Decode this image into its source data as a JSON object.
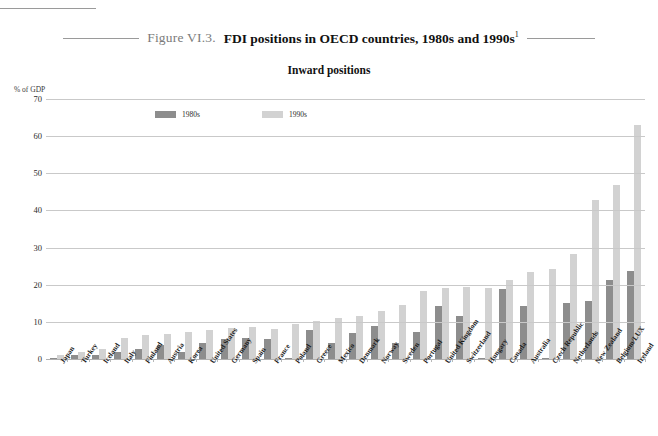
{
  "figure": {
    "number": "Figure VI.3.",
    "title": "FDI positions in OECD countries, 1980s and 1990s",
    "footnote_marker": "1",
    "subtitle": "Inward positions"
  },
  "legend": {
    "position": "top-left-inside",
    "items": [
      {
        "label": "1980s",
        "color": "#8d8d8d"
      },
      {
        "label": "1990s",
        "color": "#d2d2d2"
      }
    ]
  },
  "axis": {
    "y_unit_label": "% of GDP",
    "y_ticks": [
      "70",
      "60",
      "50",
      "40",
      "30",
      "20",
      "10",
      "0"
    ]
  },
  "chart_data": {
    "type": "bar",
    "title": "FDI positions in OECD countries, 1980s and 1990s",
    "subtitle": "Inward positions",
    "xlabel": "",
    "ylabel": "% of GDP",
    "ylim": [
      0,
      70
    ],
    "ytick_step": 10,
    "grid": true,
    "legend_position": "inside top-left",
    "categories": [
      "Japan",
      "Turkey",
      "Iceland",
      "Italy",
      "Finland",
      "Austria",
      "Korea",
      "United States",
      "Germany",
      "Spain",
      "France",
      "Poland",
      "Greece",
      "Mexico",
      "Denmark",
      "Norway",
      "Sweden",
      "Portugal",
      "United Kingdom",
      "Switzerland",
      "Hungary",
      "Canada",
      "Australia",
      "Czech Republic",
      "Netherlands",
      "New Zealand",
      "Belgium/LUX",
      "Ireland"
    ],
    "series": [
      {
        "name": "1980s",
        "color": "#8d8d8d",
        "values": [
          0.3,
          1.0,
          1.0,
          2.0,
          2.7,
          3.7,
          2.0,
          4.3,
          5.3,
          5.6,
          5.5,
          0.2,
          7.8,
          4.4,
          7.0,
          9.0,
          4.3,
          7.2,
          14.2,
          11.7,
          0.2,
          18.8,
          14.4,
          0.2,
          15.2,
          15.5,
          21.4,
          23.6
        ]
      },
      {
        "name": "1990s",
        "color": "#d2d2d2",
        "values": [
          1.1,
          2.0,
          2.8,
          5.6,
          6.6,
          6.8,
          7.4,
          7.7,
          8.4,
          8.6,
          8.0,
          9.3,
          10.2,
          11.0,
          11.6,
          12.8,
          14.5,
          18.2,
          19.0,
          19.3,
          19.0,
          21.3,
          23.3,
          24.3,
          28.4,
          42.7,
          46.8,
          63.0
        ]
      }
    ]
  }
}
